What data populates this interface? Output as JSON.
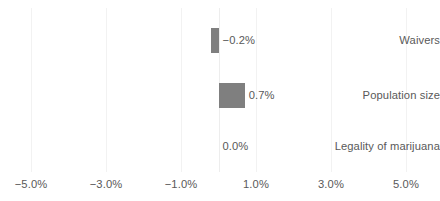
{
  "chart_data": {
    "type": "bar",
    "orientation": "horizontal",
    "title": "",
    "subtitle": "",
    "xlabel": "",
    "ylabel": "",
    "categories": [
      "Waivers",
      "Population size",
      "Legality of marijuana"
    ],
    "values": [
      -0.2,
      0.7,
      0.0
    ],
    "value_labels": [
      "−0.2%",
      "0.7%",
      "0.0%"
    ],
    "xlim": [
      -6.0,
      6.0
    ],
    "xticks": [
      -5.0,
      -3.0,
      -1.0,
      1.0,
      3.0,
      5.0
    ],
    "xtick_labels": [
      "−5.0%",
      "−3.0%",
      "−1.0%",
      "1.0%",
      "3.0%",
      "5.0%"
    ],
    "grid": true,
    "grid_axis": "x",
    "legend": false,
    "legend_position": "none",
    "bar_color": "#7f7f7f",
    "gridline_color": "#f2f2f2",
    "zero_line_color": "#ededed",
    "text_color": "#595959",
    "background_color": "#ffffff"
  },
  "axis": {
    "ticks": [
      {
        "label": "−5.0%",
        "value": -5.0
      },
      {
        "label": "−3.0%",
        "value": -3.0
      },
      {
        "label": "−1.0%",
        "value": -1.0
      },
      {
        "label": "1.0%",
        "value": 1.0
      },
      {
        "label": "3.0%",
        "value": 3.0
      },
      {
        "label": "5.0%",
        "value": 5.0
      }
    ]
  },
  "rows": [
    {
      "label": "Waivers",
      "value": -0.2,
      "value_label": "−0.2%"
    },
    {
      "label": "Population size",
      "value": 0.7,
      "value_label": "0.7%"
    },
    {
      "label": "Legality of marijuana",
      "value": 0.0,
      "value_label": "0.0%"
    }
  ]
}
